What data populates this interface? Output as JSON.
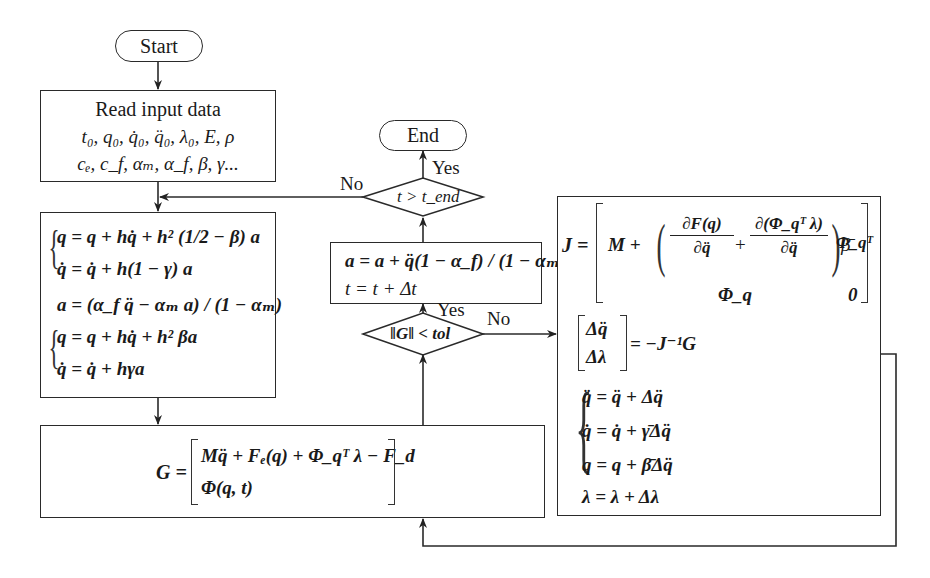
{
  "flowchart": {
    "start": {
      "label": "Start"
    },
    "end": {
      "label": "End"
    },
    "input_box": {
      "title": "Read input data",
      "line1": "t₀, q₀, q̇₀, q̈₀, λ₀, E, ρ",
      "line2": "cₑ, c_f, αₘ, α_f, β, γ..."
    },
    "predictor_box": {
      "eq1": "q = q + hq̇ + h² (1/2 − β) a",
      "eq2": "q̇ = q̇ + h(1 − γ) a",
      "eq3": "a = (α_f q̈ − αₘ a) / (1 − αₘ)",
      "eq4": "q = q + hq̇ + h² βa",
      "eq5": "q̇ = q̇ + hγa"
    },
    "residual_box": {
      "lhs": "G =",
      "row1": "Mq̈ + Fₑ(q) + Φ_qᵀ λ − F_d",
      "row2": "Φ(q, t)"
    },
    "update_box": {
      "eq1": "a = a + q̈(1 − α_f) / (1 − αₘ)",
      "eq2": "t = t + Δt"
    },
    "decision_time": {
      "condition": "t > t_end",
      "yes": "Yes",
      "no": "No"
    },
    "decision_conv": {
      "condition": "‖G‖ < tol",
      "yes": "Yes",
      "no": "No"
    },
    "newton_box": {
      "jacobian_lhs": "J =",
      "jacobian_r1c1_pre": "M +",
      "jacobian_frac1_num": "∂F(q)",
      "jacobian_frac1_den": "∂q̈",
      "jacobian_plus": "+",
      "jacobian_frac2_num": "∂(Φ_qᵀ λ)",
      "jacobian_frac2_den": "∂q̈",
      "jacobian_beta": "β̄",
      "jacobian_r1c2": "Φ_qᵀ",
      "jacobian_r2c1": "Φ_q",
      "jacobian_r2c2": "0",
      "solve_top": "Δq̈",
      "solve_bottom": "Δλ",
      "solve_rhs": "= −J⁻¹G",
      "corr1": "q̈ = q̈ + Δq̈",
      "corr2": "q̇ = q̇ + γ̄Δq̈",
      "corr3": "q = q + β̄Δq̈",
      "corr4": "λ = λ + Δλ"
    }
  }
}
